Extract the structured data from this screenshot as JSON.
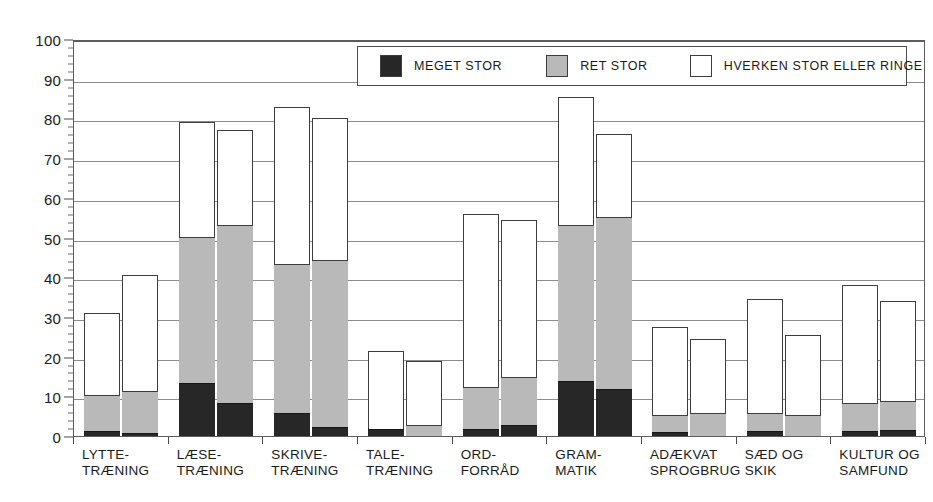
{
  "chart_data": {
    "type": "bar",
    "title": "",
    "xlabel": "",
    "ylabel": "",
    "ylim": [
      0,
      100
    ],
    "ytick_step": 10,
    "yminor_step": 2,
    "ytick_labels": [
      "0",
      "10",
      "20",
      "30",
      "40",
      "50",
      "60",
      "70",
      "80",
      "90",
      "100"
    ],
    "grid": true,
    "stacked": true,
    "bars_per_category": 2,
    "legend_position": "top-center-inside",
    "categories": [
      "LYTTE-\nTRÆNING",
      "LÆSE-\nTRÆNING",
      "SKRIVE-\nTRÆNING",
      "TALE-\nTRÆNING",
      "ORD-\nFORRÅD",
      "GRAM-\nMATIK",
      "ADÆKVAT\nSPROGBRUG",
      "SÆD OG\nSKIK",
      "KULTUR OG\nSAMFUND"
    ],
    "category_lines": [
      [
        "LYTTE-",
        "TRÆNING"
      ],
      [
        "LÆSE-",
        "TRÆNING"
      ],
      [
        "SKRIVE-",
        "TRÆNING"
      ],
      [
        "TALE-",
        "TRÆNING"
      ],
      [
        "ORD-",
        "FORRÅD"
      ],
      [
        "GRAM-",
        "MATIK"
      ],
      [
        "ADÆKVAT",
        "SPROGBRUG"
      ],
      [
        "SÆD OG",
        "SKIK"
      ],
      [
        "KULTUR OG",
        "SAMFUND"
      ]
    ],
    "series": [
      {
        "name": "MEGET STOR",
        "color": "#272727",
        "bar1": [
          1.0,
          13.0,
          5.5,
          1.5,
          1.5,
          13.5,
          0.8,
          1.0,
          1.0
        ],
        "bar2": [
          0.5,
          8.0,
          2.0,
          0.0,
          2.5,
          11.5,
          0.0,
          0.0,
          1.2
        ]
      },
      {
        "name": "RET STOR",
        "color": "#b9b9b9",
        "bar1": [
          9.0,
          37.0,
          37.5,
          0.0,
          10.5,
          39.5,
          4.2,
          4.5,
          7.0
        ],
        "bar2": [
          10.5,
          45.0,
          42.0,
          2.5,
          12.0,
          43.5,
          5.5,
          5.0,
          7.3
        ]
      },
      {
        "name": "HVERKEN STOR ELLER RINGE",
        "color": "#ffffff",
        "bar1": [
          21.0,
          29.0,
          40.0,
          20.0,
          44.0,
          32.5,
          22.5,
          29.0,
          30.0
        ],
        "bar2": [
          29.5,
          24.0,
          36.0,
          16.5,
          40.0,
          21.0,
          19.0,
          20.5,
          25.5
        ]
      }
    ],
    "totals": {
      "bar1": [
        31.0,
        79.0,
        83.0,
        21.5,
        56.0,
        85.5,
        27.5,
        34.5,
        38.0
      ],
      "bar2": [
        40.5,
        77.0,
        80.0,
        19.0,
        54.5,
        76.0,
        24.5,
        25.5,
        34.0
      ]
    },
    "cumulative_tops": {
      "meget_bar1": [
        1.0,
        13.0,
        5.5,
        1.5,
        1.5,
        13.5,
        0.8,
        1.0,
        1.0
      ],
      "ret_bar1": [
        10.0,
        50.0,
        43.0,
        1.5,
        12.0,
        53.0,
        5.0,
        5.5,
        8.0
      ],
      "meget_bar2": [
        0.5,
        8.0,
        2.0,
        0.0,
        2.5,
        11.5,
        0.0,
        0.0,
        1.2
      ],
      "ret_bar2": [
        11.0,
        53.0,
        44.0,
        2.5,
        14.5,
        55.0,
        5.5,
        5.0,
        8.5
      ]
    }
  },
  "legend": {
    "items": [
      {
        "label": "MEGET STOR",
        "swatch": "dark"
      },
      {
        "label": "RET STOR",
        "swatch": "gray"
      },
      {
        "label": "HVERKEN STOR ELLER RINGE",
        "swatch": "white"
      }
    ]
  },
  "colors": {
    "meget_stor": "#272727",
    "ret_stor": "#b9b9b9",
    "hverken": "#ffffff",
    "axis": "#4a4a4a",
    "grid": "#8c8c8c",
    "background": "#ffffff"
  }
}
